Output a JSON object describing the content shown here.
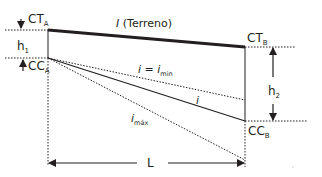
{
  "diagram": {
    "labels": {
      "ct_a": "CT",
      "ct_a_sub": "A",
      "ct_b": "CT",
      "ct_b_sub": "B",
      "cc_a": "CC",
      "cc_a_sub": "A",
      "cc_b": "CC",
      "cc_b_sub": "B",
      "h1": "h",
      "h1_sub": "1",
      "h2": "h",
      "h2_sub": "2",
      "terrain_i": "I",
      "terrain_text": " (Terreno)",
      "i_min_lhs": "i",
      "i_min_eq": " = ",
      "i_min_rhs": "i",
      "i_min_sub": "min",
      "i_mid": "i",
      "i_max": "i",
      "i_max_sub": "máx",
      "length": "L"
    },
    "colors": {
      "line": "#231f20",
      "background": "#ffffff"
    }
  }
}
